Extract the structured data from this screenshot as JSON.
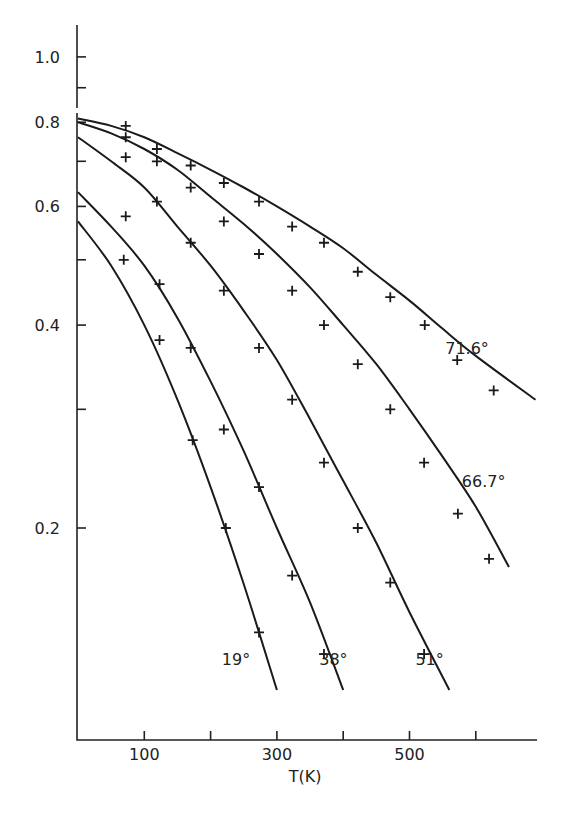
{
  "chart_data": {
    "type": "line",
    "title": "",
    "xlabel": "T(K)",
    "ylabel": "",
    "xlim": [
      0,
      690
    ],
    "ylim": [
      0.11,
      1.1
    ],
    "yscale": "log",
    "grid": false,
    "legend": "none (curves labeled inline)",
    "x_ticks": [
      100,
      200,
      300,
      400,
      500,
      600
    ],
    "x_tick_labels": [
      "100",
      "",
      "300",
      "",
      "500",
      ""
    ],
    "y_ticks": [
      0.2,
      0.3,
      0.4,
      0.5,
      0.6,
      0.7,
      0.8,
      0.9,
      1.0
    ],
    "y_tick_labels": [
      "0.2",
      "",
      "0.4",
      "",
      "0.6",
      "",
      "0.8",
      "",
      "1.0"
    ],
    "series": [
      {
        "name": "71.6°",
        "points_x": [
          72,
          119,
          170,
          220,
          273,
          323,
          371,
          422,
          471,
          523,
          572,
          627
        ],
        "points_y": [
          0.79,
          0.73,
          0.69,
          0.65,
          0.61,
          0.56,
          0.53,
          0.48,
          0.44,
          0.4,
          0.355,
          0.32
        ],
        "curve_x": [
          0,
          50,
          100,
          150,
          200,
          250,
          300,
          350,
          400,
          450,
          500,
          550,
          600,
          690
        ],
        "curve_y": [
          0.81,
          0.79,
          0.76,
          0.72,
          0.68,
          0.64,
          0.6,
          0.56,
          0.52,
          0.475,
          0.435,
          0.395,
          0.36,
          0.31
        ]
      },
      {
        "name": "66.7°",
        "points_x": [
          72,
          119,
          170,
          220,
          273,
          323,
          371,
          422,
          471,
          522,
          573,
          620
        ],
        "points_y": [
          0.76,
          0.7,
          0.64,
          0.57,
          0.51,
          0.45,
          0.4,
          0.35,
          0.3,
          0.25,
          0.21,
          0.18
        ],
        "curve_x": [
          0,
          50,
          100,
          150,
          200,
          250,
          300,
          350,
          400,
          450,
          500,
          550,
          600,
          650
        ],
        "curve_y": [
          0.8,
          0.77,
          0.73,
          0.68,
          0.62,
          0.565,
          0.51,
          0.455,
          0.4,
          0.35,
          0.3,
          0.255,
          0.215,
          0.175
        ]
      },
      {
        "name": "51°",
        "points_x": [
          72,
          119,
          170,
          220,
          273,
          323,
          371,
          422,
          471,
          522
        ],
        "points_y": [
          0.71,
          0.61,
          0.53,
          0.45,
          0.37,
          0.31,
          0.25,
          0.2,
          0.166,
          0.13
        ],
        "curve_x": [
          0,
          50,
          100,
          150,
          200,
          250,
          300,
          350,
          400,
          450,
          500,
          560
        ],
        "curve_y": [
          0.76,
          0.7,
          0.64,
          0.56,
          0.49,
          0.42,
          0.355,
          0.29,
          0.235,
          0.19,
          0.15,
          0.115
        ]
      },
      {
        "name": "38°",
        "points_x": [
          72,
          123,
          170,
          220,
          273,
          323,
          371
        ],
        "points_y": [
          0.58,
          0.46,
          0.37,
          0.28,
          0.23,
          0.17,
          0.13
        ],
        "curve_x": [
          0,
          50,
          100,
          150,
          200,
          250,
          300,
          350,
          400
        ],
        "curve_y": [
          0.63,
          0.56,
          0.49,
          0.41,
          0.33,
          0.26,
          0.2,
          0.155,
          0.115
        ]
      },
      {
        "name": "19°",
        "points_x": [
          69,
          123,
          173,
          223,
          273
        ],
        "points_y": [
          0.5,
          0.38,
          0.27,
          0.2,
          0.14
        ],
        "curve_x": [
          0,
          50,
          100,
          150,
          200,
          250,
          300
        ],
        "curve_y": [
          0.57,
          0.49,
          0.4,
          0.31,
          0.23,
          0.165,
          0.115
        ]
      }
    ],
    "annotations": [
      {
        "text": "71.6°",
        "x": 575,
        "y": 0.37
      },
      {
        "text": "66.7°",
        "x": 600,
        "y": 0.235
      },
      {
        "text": "51°",
        "x": 530,
        "y": 0.128
      },
      {
        "text": "38°",
        "x": 385,
        "y": 0.128
      },
      {
        "text": "19°",
        "x": 238,
        "y": 0.128
      }
    ]
  }
}
